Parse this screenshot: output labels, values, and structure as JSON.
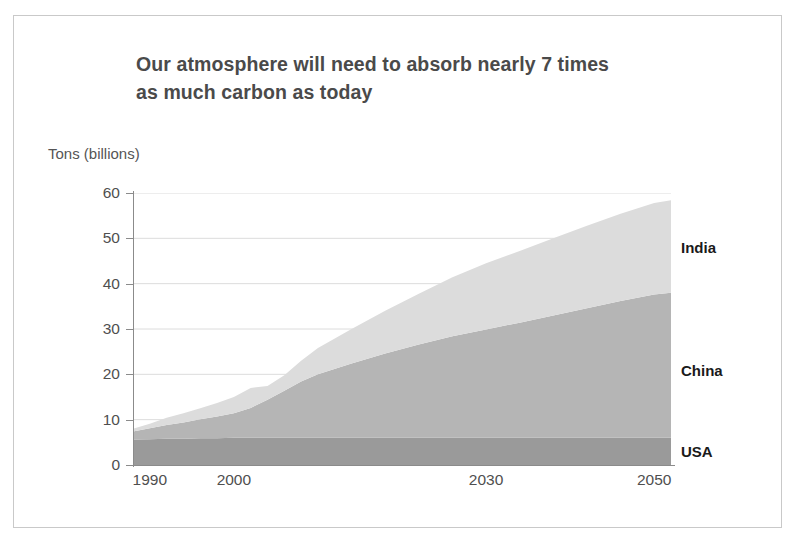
{
  "title": {
    "line1": "Our atmosphere will need to absorb nearly 7 times",
    "line2": "as much carbon as today"
  },
  "chart_data": {
    "type": "area",
    "stacked": true,
    "title": "Our atmosphere will need to absorb nearly 7 times as much carbon as today",
    "subtitle": "",
    "xlabel": "",
    "ylabel": "Tons (billions)",
    "ylim": [
      0,
      60
    ],
    "xlim": [
      1988,
      2052
    ],
    "grid": "horizontal",
    "legend_position": "right-inline",
    "yticks": [
      0,
      10,
      20,
      30,
      40,
      50,
      60
    ],
    "ytick_labels": [
      "0",
      "10",
      "20",
      "30",
      "40",
      "50",
      "60"
    ],
    "xticks": [
      1990,
      2000,
      2030,
      2050
    ],
    "xtick_labels": [
      "1990",
      "2000",
      "2030",
      "2050"
    ],
    "x": [
      1988,
      1990,
      1992,
      1994,
      1996,
      1998,
      2000,
      2002,
      2004,
      2006,
      2008,
      2010,
      2014,
      2018,
      2022,
      2026,
      2030,
      2034,
      2038,
      2042,
      2046,
      2050,
      2052
    ],
    "series": [
      {
        "name": "USA",
        "color": "#9a9a9a",
        "values": [
          5.6,
          5.7,
          5.8,
          5.8,
          5.9,
          5.9,
          6.0,
          6.0,
          6.0,
          6.0,
          6.0,
          6.0,
          6.0,
          6.0,
          6.0,
          6.0,
          6.0,
          6.0,
          6.0,
          6.0,
          6.0,
          6.0,
          6.0
        ]
      },
      {
        "name": "China",
        "color": "#b5b5b5",
        "values": [
          1.8,
          2.4,
          3.0,
          3.6,
          4.2,
          4.8,
          5.4,
          6.6,
          8.4,
          10.4,
          12.4,
          14.0,
          16.4,
          18.6,
          20.6,
          22.4,
          23.9,
          25.4,
          27.0,
          28.6,
          30.2,
          31.6,
          32.0
        ]
      },
      {
        "name": "India",
        "color": "#dcdcdc",
        "values": [
          0.6,
          1.0,
          1.6,
          2.0,
          2.4,
          3.0,
          3.6,
          4.4,
          3.0,
          3.4,
          4.6,
          5.8,
          7.6,
          9.4,
          11.2,
          13.0,
          14.6,
          15.8,
          17.0,
          18.2,
          19.2,
          20.2,
          20.4
        ]
      }
    ],
    "stack_totals_note": {
      "1990": 9.1,
      "2000": 15.0,
      "2002": 17.0,
      "2004": 17.4,
      "2010": 25.8,
      "2030": 44.5,
      "2050": 57.8
    },
    "legend": [
      {
        "label": "India",
        "color": "#dcdcdc",
        "y_value": 48
      },
      {
        "label": "China",
        "color": "#b5b5b5",
        "y_value": 21
      },
      {
        "label": "USA",
        "color": "#9a9a9a",
        "y_value": 3
      }
    ]
  }
}
